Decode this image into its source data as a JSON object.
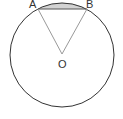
{
  "diagram": {
    "type": "circle-sector-segment",
    "circle": {
      "cx": 62,
      "cy": 55,
      "r": 52,
      "stroke": "#333333"
    },
    "center": {
      "label": "O",
      "x": 62,
      "y": 54
    },
    "points": [
      {
        "label": "A",
        "x": 38,
        "y": 9
      },
      {
        "label": "B",
        "x": 87,
        "y": 9
      }
    ],
    "shaded_region": {
      "description": "circular segment between chord AB and minor arc AB",
      "fill": "#d3d3d3"
    },
    "line_color": "#999999"
  }
}
